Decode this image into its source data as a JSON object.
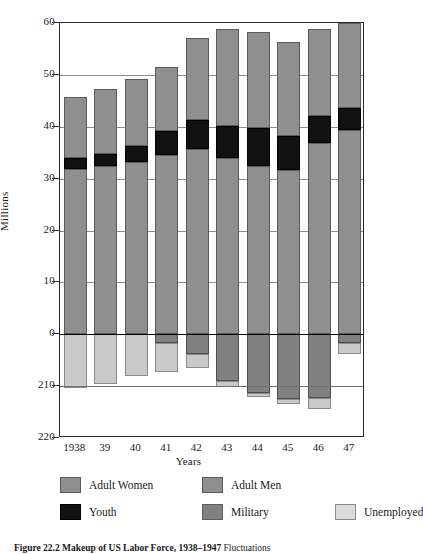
{
  "figure": {
    "caption_bold": "Figure 22.2  Makeup of US Labor Force, 1938–1947",
    "caption_rest": " Fluctuations"
  },
  "axes": {
    "ylabel": "Millions",
    "xlabel": "Years",
    "yticks": [
      "60",
      "50",
      "40",
      "30",
      "20",
      "10",
      "0",
      "210",
      "220"
    ],
    "ytick_values": [
      60,
      50,
      40,
      30,
      20,
      10,
      0,
      -10,
      -20
    ],
    "xticks": [
      "1938",
      "39",
      "40",
      "41",
      "42",
      "43",
      "44",
      "45",
      "46",
      "47"
    ]
  },
  "legend": {
    "items": [
      {
        "label": "Adult Women",
        "key": "women",
        "color": "#8f8f8f"
      },
      {
        "label": "Adult Men",
        "key": "men",
        "color": "#8f8f8f"
      },
      {
        "label": "Youth",
        "key": "youth",
        "color": "#111111"
      },
      {
        "label": "Military",
        "key": "military",
        "color": "#808080"
      },
      {
        "label": "Unemployed",
        "key": "unemp",
        "color": "#dcdcdc"
      }
    ]
  },
  "chart_data": {
    "type": "bar",
    "title": "Figure 22.2  Makeup of US Labor Force, 1938–1947",
    "xlabel": "Years",
    "ylabel": "Millions",
    "ylim": [
      -20,
      60
    ],
    "yticks": [
      -20,
      -10,
      0,
      10,
      20,
      30,
      40,
      50,
      60
    ],
    "ytick_labels": [
      "220",
      "210",
      "0",
      "10",
      "20",
      "30",
      "40",
      "50",
      "60"
    ],
    "grid": true,
    "stacked": true,
    "legend_position": "below",
    "categories": [
      "1938",
      "39",
      "40",
      "41",
      "42",
      "43",
      "44",
      "45",
      "46",
      "47"
    ],
    "series": [
      {
        "name": "Adult Men",
        "stack": "positive",
        "color": "#8f8f8f",
        "values": [
          31.8,
          32.4,
          33.2,
          34.6,
          35.8,
          34.0,
          32.4,
          31.6,
          36.8,
          39.4
        ]
      },
      {
        "name": "Youth",
        "stack": "positive",
        "color": "#111111",
        "values": [
          2.1,
          2.4,
          3.0,
          4.6,
          5.5,
          6.2,
          7.3,
          6.6,
          5.2,
          4.2
        ]
      },
      {
        "name": "Adult Women",
        "stack": "positive",
        "color": "#8f8f8f",
        "values": [
          11.9,
          12.4,
          13.1,
          12.3,
          15.9,
          18.7,
          18.5,
          18.2,
          16.9,
          16.4
        ]
      },
      {
        "name": "Military",
        "stack": "negative",
        "color": "#808080",
        "values": [
          0.0,
          0.0,
          0.0,
          1.6,
          3.9,
          9.0,
          11.4,
          12.4,
          12.2,
          1.6
        ]
      },
      {
        "name": "Unemployed",
        "stack": "negative",
        "color": "#dcdcdc",
        "values": [
          10.4,
          9.5,
          8.1,
          5.6,
          2.7,
          1.1,
          0.7,
          1.0,
          2.3,
          2.3
        ]
      }
    ],
    "totals_positive": [
      45.8,
      47.2,
      49.3,
      51.5,
      57.2,
      58.9,
      58.2,
      56.4,
      58.9,
      60.0
    ],
    "totals_negative": [
      10.4,
      9.5,
      8.1,
      7.2,
      6.6,
      10.1,
      12.1,
      13.4,
      14.5,
      3.9
    ]
  }
}
